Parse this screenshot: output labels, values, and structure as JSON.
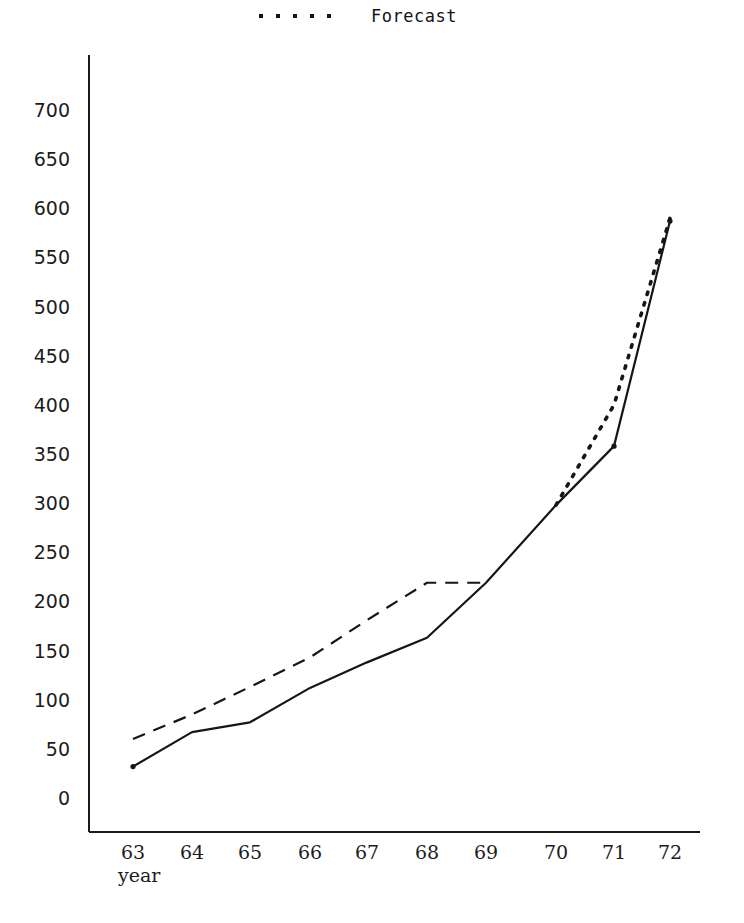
{
  "legend": {
    "sample_icon": "dotted-line-sample",
    "dot_count": 5,
    "label": "Forecast"
  },
  "axes": {
    "x_title": "year",
    "y_ticks": [
      "700",
      "650",
      "600",
      "550",
      "500",
      "450",
      "400",
      "350",
      "300",
      "250",
      "200",
      "150",
      "100",
      "50",
      "0"
    ],
    "x_ticks": [
      "63",
      "64",
      "65",
      "66",
      "67",
      "68",
      "69",
      "70",
      "71",
      "72"
    ]
  },
  "chart_data": {
    "type": "line",
    "title": "",
    "xlabel": "year",
    "ylabel": "",
    "x": [
      63,
      64,
      65,
      66,
      67,
      68,
      69,
      70,
      71,
      72
    ],
    "xlim": [
      62.6,
      72.4
    ],
    "ylim": [
      0,
      700
    ],
    "y_tick_values": [
      0,
      50,
      100,
      150,
      200,
      250,
      300,
      350,
      400,
      450,
      500,
      550,
      600,
      650,
      700
    ],
    "grid": false,
    "legend_position": "top-center",
    "series": [
      {
        "name": "Actual",
        "style": "solid",
        "color": "#161616",
        "x": [
          63,
          64,
          65,
          66,
          67,
          68,
          69,
          70,
          71,
          72
        ],
        "values": [
          32,
          67,
          77,
          112,
          138,
          163,
          219,
          298,
          358,
          587
        ]
      },
      {
        "name": "Estimate",
        "style": "dashed",
        "color": "#161616",
        "x": [
          63,
          64,
          65,
          66,
          67,
          68,
          69
        ],
        "values": [
          60,
          85,
          113,
          143,
          181,
          219,
          219
        ]
      },
      {
        "name": "Forecast",
        "style": "dotted",
        "color": "#161616",
        "x": [
          70,
          71,
          72
        ],
        "values": [
          298,
          400,
          590
        ]
      }
    ]
  },
  "geometry": {
    "plot_left": 89,
    "plot_right": 700,
    "axis_top": 55,
    "y_zero_px": 798,
    "y_top_px": 110,
    "x_positions": [
      133,
      192,
      250,
      310,
      367,
      427,
      486,
      556,
      614,
      670
    ]
  }
}
